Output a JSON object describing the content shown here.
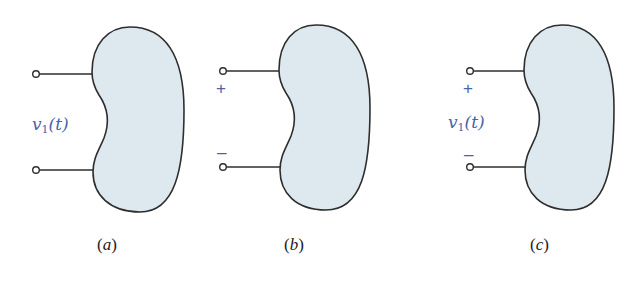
{
  "figure": {
    "colors": {
      "blob_fill": "#dde9ef",
      "outline": "#2e2e2e",
      "label": "#4a63a8",
      "caption": "#222222"
    },
    "panels": [
      {
        "id": "a",
        "caption_open": "(",
        "caption_letter": "a",
        "caption_close": ")",
        "voltage_symbol": "v",
        "voltage_subscript": "1",
        "voltage_arg": "(t)",
        "plus_sign": "",
        "minus_sign": ""
      },
      {
        "id": "b",
        "caption_open": "(",
        "caption_letter": "b",
        "caption_close": ")",
        "voltage_symbol": "",
        "voltage_subscript": "",
        "voltage_arg": "",
        "plus_sign": "+",
        "minus_sign": "–"
      },
      {
        "id": "c",
        "caption_open": "(",
        "caption_letter": "c",
        "caption_close": ")",
        "voltage_symbol": "v",
        "voltage_subscript": "1",
        "voltage_arg": "(t)",
        "plus_sign": "+",
        "minus_sign": "–"
      }
    ]
  }
}
